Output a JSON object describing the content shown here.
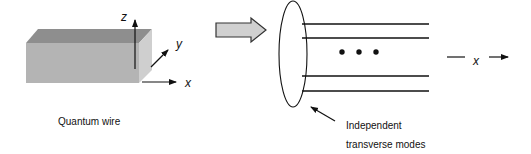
{
  "left_panel": {
    "caption": "Quantum wire",
    "axes": {
      "z": "z",
      "y": "y",
      "x": "x"
    },
    "colors": {
      "front": "#b4b4b4",
      "top": "#8e8e8e",
      "side": "#cfcfcf"
    }
  },
  "transition_arrow": {
    "fill": "#d0d0d0",
    "stroke": "#333333"
  },
  "right_panel": {
    "mode_lines_count": 4,
    "ellipsis": "• • •",
    "propagation_axis": "x",
    "annotation_line1": "Independent",
    "annotation_line2": "transverse modes"
  }
}
